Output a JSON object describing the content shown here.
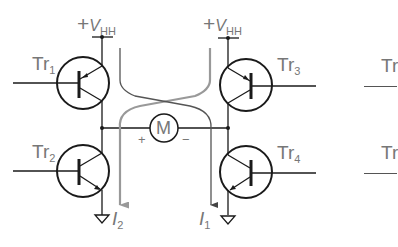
{
  "diagram": {
    "type": "H-bridge motor driver schematic",
    "colors": {
      "wire": "#1a1a1a",
      "label": "#777777",
      "current_path_1": "#555555",
      "current_path_2": "#999999"
    },
    "supplies": [
      {
        "id": "vhh-left",
        "sign": "+",
        "symbol": "V",
        "subscript": "HH"
      },
      {
        "id": "vhh-right",
        "sign": "+",
        "symbol": "V",
        "subscript": "HH"
      }
    ],
    "transistors": [
      {
        "id": "tr1",
        "name": "Tr",
        "subscript": "1",
        "type": "PNP",
        "position": "upper-left"
      },
      {
        "id": "tr2",
        "name": "Tr",
        "subscript": "2",
        "type": "NPN",
        "position": "lower-left"
      },
      {
        "id": "tr3",
        "name": "Tr",
        "subscript": "3",
        "type": "PNP",
        "position": "upper-right"
      },
      {
        "id": "tr4",
        "name": "Tr",
        "subscript": "4",
        "type": "NPN",
        "position": "lower-right"
      }
    ],
    "motor": {
      "label": "M",
      "plus": "+",
      "minus": "−"
    },
    "currents": [
      {
        "id": "i1",
        "symbol": "I",
        "subscript": "1"
      },
      {
        "id": "i2",
        "symbol": "I",
        "subscript": "2"
      }
    ],
    "partial_labels": [
      {
        "id": "tr-partial-top",
        "text": "Tr"
      },
      {
        "id": "tr-partial-bottom",
        "text": "Tr"
      }
    ]
  }
}
